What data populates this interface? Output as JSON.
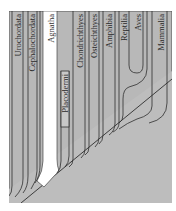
{
  "diagram": {
    "type": "phylogenetic-tree",
    "colors": {
      "background": "#b8b8b8",
      "branch_fill": "#c4c4c4",
      "outline": "#2e2e2e",
      "highlight": "#ffffff",
      "frame": "#555555"
    },
    "taxa": [
      {
        "label": "Urochordata"
      },
      {
        "label": "Cephalochordata"
      },
      {
        "label": "Agnatha",
        "highlighted": true
      },
      {
        "label": "Placodermi",
        "boxed": true,
        "extinct": true
      },
      {
        "label": "Chondrichthyes"
      },
      {
        "label": "Osteichthyes"
      },
      {
        "label": "Amphibia"
      },
      {
        "label": "Reptilia"
      },
      {
        "label": "Aves"
      },
      {
        "label": "Mammalia"
      }
    ]
  }
}
